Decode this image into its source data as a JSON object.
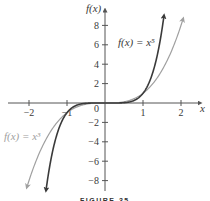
{
  "figure": {
    "caption": "FIGURE 35",
    "y_axis_label": "f(x)",
    "x_axis_label": "x",
    "origin_label": "0"
  },
  "colors": {
    "x5_curve": "#3a3a3a",
    "x3_curve": "#a0a0a0",
    "axis": "#555555"
  },
  "chart_data": {
    "type": "line",
    "title": "",
    "xlabel": "x",
    "ylabel": "f(x)",
    "xlim": [
      -2.5,
      2.5
    ],
    "ylim": [
      -9,
      9
    ],
    "grid": false,
    "x_ticks": [
      -2,
      -1,
      1,
      2
    ],
    "x_tick_labels": [
      "−2",
      "−1",
      "1",
      "2"
    ],
    "y_ticks": [
      8,
      6,
      4,
      2,
      -2,
      -4,
      -6,
      -8
    ],
    "y_tick_labels": [
      "8",
      "6",
      "4",
      "2",
      "−2",
      "−4",
      "−6",
      "−8"
    ],
    "series": [
      {
        "name": "f(x) = x^5",
        "label": "f(x) = x⁵",
        "color": "#3a3a3a",
        "x": [
          -1.55,
          -1.5,
          -1.25,
          -1,
          -0.75,
          -0.5,
          -0.25,
          0,
          0.25,
          0.5,
          0.75,
          1,
          1.25,
          1.5,
          1.55
        ],
        "values": [
          -8.95,
          -7.59,
          -3.05,
          -1,
          -0.24,
          -0.03,
          0,
          0,
          0,
          0.03,
          0.24,
          1,
          3.05,
          7.59,
          8.95
        ]
      },
      {
        "name": "f(x) = x^3",
        "label": "f(x) = x³",
        "color": "#a0a0a0",
        "x": [
          -2.05,
          -2,
          -1.5,
          -1,
          -0.5,
          0,
          0.5,
          1,
          1.5,
          2,
          2.05
        ],
        "values": [
          -8.62,
          -8,
          -3.375,
          -1,
          -0.125,
          0,
          0.125,
          1,
          3.375,
          8,
          8.62
        ]
      }
    ],
    "annotations": [
      {
        "text": "f(x) = x⁵",
        "x": 0.35,
        "y": 6
      },
      {
        "text": "f(x) = x³",
        "x": -2.7,
        "y": -3.5
      }
    ],
    "legend": "none (inline labels)"
  }
}
